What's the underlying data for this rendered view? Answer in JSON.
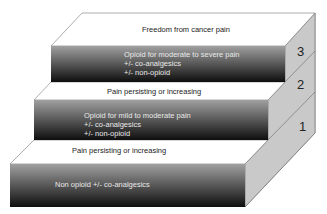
{
  "diagram": {
    "type": "staircase",
    "goal": "Freedom from cancer pain",
    "steps": [
      {
        "number": "1",
        "front_lines": [
          "Non opioid +/- co-analgesics"
        ],
        "transition": "Pain persisting or increasing"
      },
      {
        "number": "2",
        "front_lines": [
          "Opioid for mild to moderate pain",
          "+/- co-analgesics",
          "+/- non-opioid"
        ],
        "transition": "Pain persisting or increasing"
      },
      {
        "number": "3",
        "front_lines": [
          "Opioid for moderate to severe pain",
          "+/- co-analgesics",
          "+/- non-opioid"
        ]
      }
    ],
    "colors": {
      "front_top": "#9a9a9a",
      "front_bottom": "#111111",
      "top_face": "#ffffff",
      "side_face": "#c8c8c8",
      "edge": "#555555"
    }
  }
}
